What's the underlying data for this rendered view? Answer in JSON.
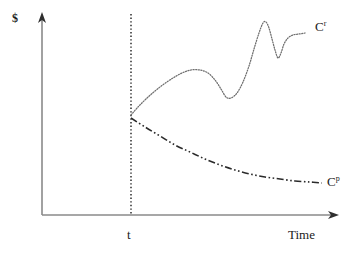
{
  "figure": {
    "background_color": "#ffffff",
    "width": 359,
    "height": 256
  },
  "axes": {
    "y_label": "$",
    "x_label": "Time",
    "axis_color": "#8a8a8a",
    "origin": [
      42,
      215
    ],
    "x_axis_end": [
      338,
      215
    ],
    "y_axis_top": [
      42,
      13
    ],
    "arrow_color": "#3a3a3a"
  },
  "event_marker": {
    "label": "t",
    "x": 131,
    "line_style": "dotted",
    "color": "#2b2b2b",
    "y_top": 14,
    "y_bottom": 215
  },
  "curves": {
    "recovery": {
      "label_text": "C",
      "label_sup": "r",
      "line_style": "dotted",
      "color": "#6f6f6f"
    },
    "persistent": {
      "label_text": "C",
      "label_sup": "p",
      "line_style": "dash-dot-dot",
      "color": "#2b2b2b"
    }
  },
  "chart_data": {
    "type": "line",
    "title": "",
    "xlabel": "Time",
    "ylabel": "$",
    "grid": false,
    "legend": "inline-end-of-curve-labels",
    "xlim": [
      42,
      338
    ],
    "ylim": [
      215,
      13
    ],
    "annotations": [
      {
        "text": "t",
        "x": 131,
        "y": 237,
        "describes": "shock time on Time axis"
      },
      {
        "text": "C^r",
        "x": 318,
        "y": 28,
        "describes": "recovering cost path label"
      },
      {
        "text": "C^p",
        "x": 330,
        "y": 182,
        "describes": "persistent cost path label"
      }
    ],
    "series": [
      {
        "name": "C^r",
        "style": "dotted",
        "points": [
          [
            131,
            115
          ],
          [
            138,
            107
          ],
          [
            146,
            99
          ],
          [
            155,
            91
          ],
          [
            164,
            84
          ],
          [
            173,
            78
          ],
          [
            182,
            73
          ],
          [
            191,
            70
          ],
          [
            200,
            70
          ],
          [
            208,
            73
          ],
          [
            215,
            80
          ],
          [
            221,
            89
          ],
          [
            226,
            97
          ],
          [
            231,
            98
          ],
          [
            237,
            93
          ],
          [
            243,
            82
          ],
          [
            249,
            66
          ],
          [
            254,
            49
          ],
          [
            259,
            33
          ],
          [
            263,
            23
          ],
          [
            266,
            22
          ],
          [
            269,
            28
          ],
          [
            272,
            39
          ],
          [
            275,
            50
          ],
          [
            278,
            58
          ],
          [
            281,
            53
          ],
          [
            284,
            44
          ],
          [
            288,
            38
          ],
          [
            293,
            35
          ],
          [
            299,
            34
          ],
          [
            305,
            33
          ]
        ]
      },
      {
        "name": "C^p",
        "style": "dash-dot-dot",
        "points": [
          [
            131,
            118
          ],
          [
            145,
            127
          ],
          [
            160,
            136
          ],
          [
            175,
            145
          ],
          [
            190,
            152
          ],
          [
            205,
            159
          ],
          [
            220,
            165
          ],
          [
            235,
            170
          ],
          [
            250,
            174
          ],
          [
            265,
            177
          ],
          [
            280,
            179
          ],
          [
            295,
            181
          ],
          [
            310,
            182
          ],
          [
            322,
            183
          ]
        ]
      }
    ]
  }
}
